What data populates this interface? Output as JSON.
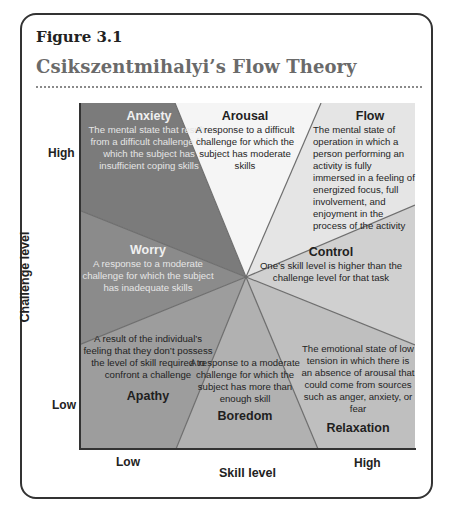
{
  "figure": {
    "label": "Figure 3.1",
    "title": "Csikszentmihalyi’s Flow Theory"
  },
  "axes": {
    "y_label": "Challenge level",
    "y_ticks": {
      "high": "High",
      "low": "Low"
    },
    "x_label": "Skill level",
    "x_ticks": {
      "low": "Low",
      "high": "High"
    }
  },
  "colors": {
    "anxiety": "#7b7b7b",
    "worry": "#8b8b8b",
    "apathy": "#9d9d9d",
    "boredom": "#b1b1b1",
    "relaxation": "#bfbfbf",
    "control": "#d0d0d0",
    "flow": "#e5e5e5",
    "arousal": "#f5f5f5",
    "divider": "#6e6e6e",
    "frame": "#333333",
    "title": "#6a6a6a"
  },
  "states": {
    "anxiety": {
      "title": "Anxiety",
      "description": "The mental state that results from a difficult challenge for which the subject has insufficient coping skills"
    },
    "arousal": {
      "title": "Arousal",
      "description": "A response to a difficult challenge for which the subject has moderate skills"
    },
    "flow": {
      "title": "Flow",
      "description": "The mental state of operation in which a person performing an activity is fully immersed in a feeling of energized focus, full involvement, and enjoyment in the process of the activity"
    },
    "worry": {
      "title": "Worry",
      "description": "A response to a moderate challenge for which the subject has inadequate skills"
    },
    "control": {
      "title": "Control",
      "description": "One’s skill level is higher than the challenge level for that task"
    },
    "apathy": {
      "title": "Apathy",
      "description": "A result of the individual’s feeling that they don’t possess the level of skill required to confront a challenge"
    },
    "boredom": {
      "title": "Boredom",
      "description": "A response to a moderate challenge for which the subject has more than enough skill"
    },
    "relaxation": {
      "title": "Relaxation",
      "description": "The emotional state of low tension in which there is an absence of arousal that could come from sources such as anger, anxiety, or fear"
    }
  }
}
